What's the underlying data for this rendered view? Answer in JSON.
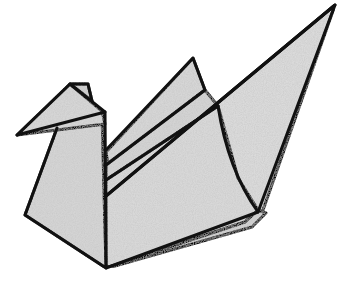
{
  "image": {
    "subject": "Origami paper swan illustration",
    "style": "black outlined line drawing with grey textured paper fill",
    "colors": {
      "background": "#ffffff",
      "paper": "#d9d9d9",
      "paper_shade": "#cfcfcf",
      "outline": "#111111",
      "speckle": "#9a9a9a"
    }
  }
}
